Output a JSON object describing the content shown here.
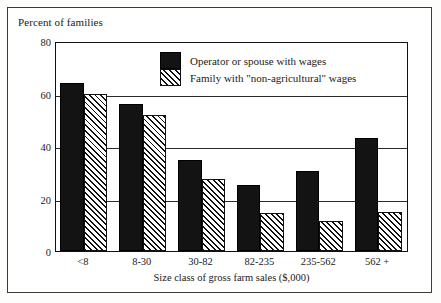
{
  "chart_data": {
    "type": "bar",
    "title": "",
    "ylabel": "Percent of families",
    "xlabel": "Size class of gross farm sales ($,000)",
    "categories": [
      "<8",
      "8-30",
      "30-82",
      "82-235",
      "235-562",
      "562 +"
    ],
    "ylim": [
      0,
      80
    ],
    "yticks": [
      0,
      20,
      40,
      60,
      80
    ],
    "ytick_labels": [
      "0",
      "20",
      "40",
      "60",
      "80"
    ],
    "grid": true,
    "legend_position": "top-center",
    "series": [
      {
        "name": "Operator or spouse with wages",
        "style": "solid-black",
        "color": "#131313",
        "values": [
          64,
          56,
          34.5,
          25,
          30.5,
          43
        ]
      },
      {
        "name": "Family with \"non-agricultural\" wages",
        "style": "diagonal-hatch",
        "color": "#ffffff",
        "values": [
          60,
          52,
          27.5,
          14.5,
          11.5,
          15
        ]
      }
    ]
  },
  "legend": {
    "items": [
      {
        "label": "Operator or spouse with wages",
        "swatch": "solid"
      },
      {
        "label": "Family with \"non-agricultural\" wages",
        "swatch": "hatch"
      }
    ]
  },
  "colors": {
    "frame": "#3b3b3b",
    "axis": "#111111",
    "grid": "#2b2b2b",
    "bar_solid": "#131313",
    "bar_hatch_line": "#111111",
    "background": "#ffffff"
  }
}
